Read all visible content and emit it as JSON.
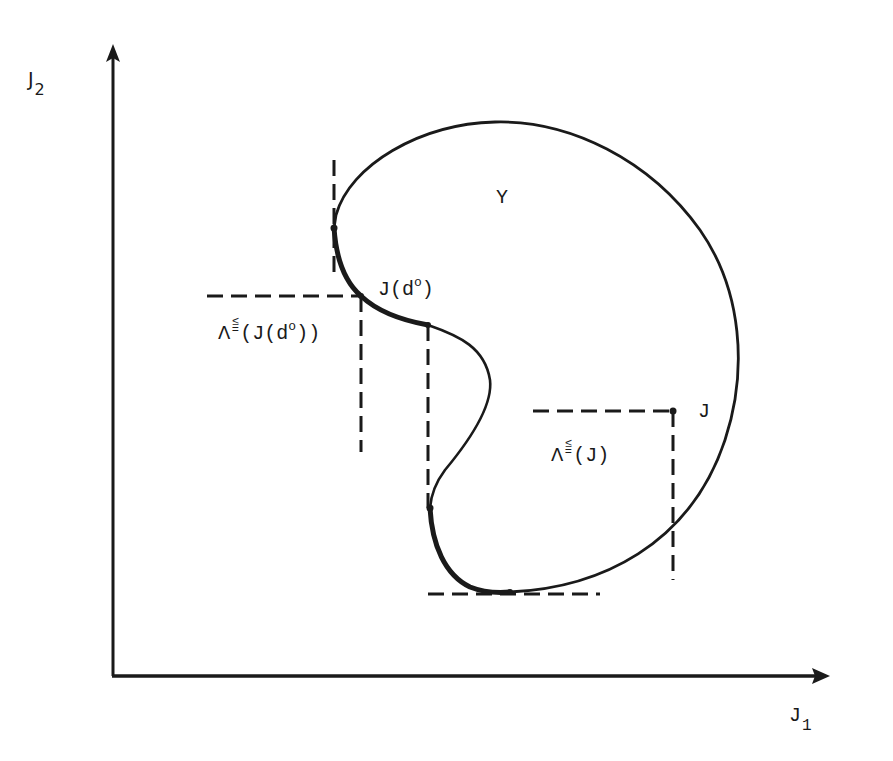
{
  "figure": {
    "type": "diagram",
    "axes": {
      "x_label": "J",
      "x_label_sub": "1",
      "y_label": "J",
      "y_label_sub": "2"
    },
    "region_label": "Y",
    "points": {
      "optimal_point_label": "J(d",
      "optimal_point_sup": "o",
      "optimal_point_close": ")",
      "general_point_label": "J"
    },
    "cone_labels": {
      "optimal_cone_prefix": "Λ",
      "optimal_cone_relation_top": "≤",
      "optimal_cone_relation_bottom": "=",
      "optimal_cone_arg": "(J(d",
      "optimal_cone_sup": "o",
      "optimal_cone_close": "))",
      "general_cone_prefix": "Λ",
      "general_cone_relation_top": "≤",
      "general_cone_relation_bottom": "=",
      "general_cone_arg": "(J)"
    },
    "colors": {
      "ink": "#1a1a1a",
      "background": "#ffffff"
    }
  }
}
